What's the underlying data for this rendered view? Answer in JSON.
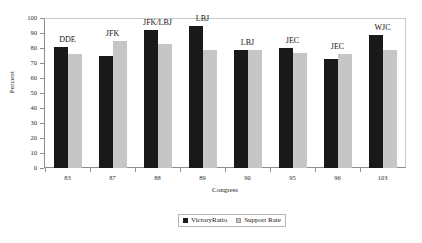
{
  "chart_data": {
    "type": "bar",
    "title": "",
    "xlabel": "Congress",
    "ylabel": "Percent",
    "categories": [
      "83",
      "87",
      "88",
      "89",
      "90",
      "95",
      "96",
      "103"
    ],
    "point_labels": [
      "DDE",
      "JFK",
      "JFK/LBJ",
      "LBJ",
      "LBJ",
      "JEC",
      "JEC",
      "WJC"
    ],
    "series": [
      {
        "name": "VictoryRatio",
        "color": "#191919",
        "values": [
          81,
          75,
          92,
          95,
          79,
          80,
          73,
          89
        ]
      },
      {
        "name": "Support Rate",
        "color": "#c6c6c6",
        "values": [
          76,
          85,
          83,
          79,
          79,
          77,
          76,
          79
        ]
      }
    ],
    "ylim": [
      0,
      100
    ],
    "yticks": [
      0,
      10,
      20,
      30,
      40,
      50,
      60,
      70,
      80,
      90,
      100
    ],
    "grid": false,
    "legend_position": "bottom-center"
  },
  "legend": {
    "victory_label": "VictoryRatio",
    "support_label": "Support Rate"
  }
}
